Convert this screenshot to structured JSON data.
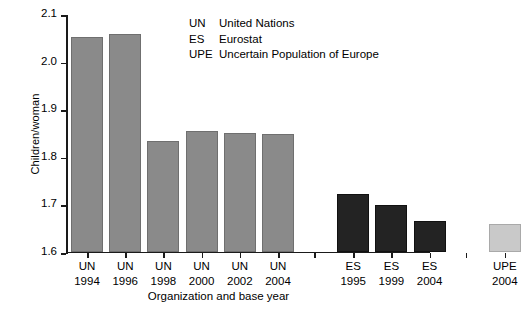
{
  "chart_data": {
    "type": "bar",
    "title": "",
    "xlabel": "Organization and base year",
    "ylabel": "Children/woman",
    "ylim": [
      1.6,
      2.1
    ],
    "yticks": [
      "2.1",
      "2.0",
      "1.9",
      "1.8",
      "1.7",
      "1.6"
    ],
    "grid": false,
    "legend_position": "top-right",
    "categories": [
      "UN 1994",
      "UN 1996",
      "UN 1998",
      "UN 2000",
      "UN 2002",
      "UN 2004",
      "ES 1995",
      "ES 1999",
      "ES 2004",
      "UPE 2004"
    ],
    "values": [
      2.052,
      2.058,
      1.833,
      1.855,
      1.851,
      1.848,
      1.722,
      1.698,
      1.665,
      1.658
    ],
    "bars": [
      {
        "org": "UN",
        "year": "1994",
        "value": 2.052,
        "group": "UN",
        "color": "#8a8a8a"
      },
      {
        "org": "UN",
        "year": "1996",
        "value": 2.058,
        "group": "UN",
        "color": "#8a8a8a"
      },
      {
        "org": "UN",
        "year": "1998",
        "value": 1.833,
        "group": "UN",
        "color": "#8a8a8a"
      },
      {
        "org": "UN",
        "year": "2000",
        "value": 1.855,
        "group": "UN",
        "color": "#8a8a8a"
      },
      {
        "org": "UN",
        "year": "2002",
        "value": 1.851,
        "group": "UN",
        "color": "#8a8a8a"
      },
      {
        "org": "UN",
        "year": "2004",
        "value": 1.848,
        "group": "UN",
        "color": "#8a8a8a"
      },
      {
        "org": "ES",
        "year": "1995",
        "value": 1.722,
        "group": "ES",
        "color": "#232323"
      },
      {
        "org": "ES",
        "year": "1999",
        "value": 1.698,
        "group": "ES",
        "color": "#232323"
      },
      {
        "org": "ES",
        "year": "2004",
        "value": 1.665,
        "group": "ES",
        "color": "#232323"
      },
      {
        "org": "UPE",
        "year": "2004",
        "value": 1.658,
        "group": "UPE",
        "color": "#c9c9c9"
      }
    ],
    "legend": [
      {
        "abbr": "UN",
        "name": "United Nations"
      },
      {
        "abbr": "ES",
        "name": "Eurostat"
      },
      {
        "abbr": "UPE",
        "name": "Uncertain Population of Europe"
      }
    ]
  }
}
